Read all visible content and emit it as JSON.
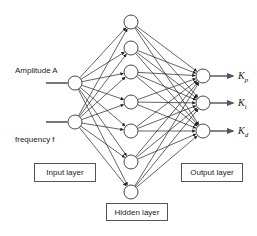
{
  "diagram": {
    "type": "neural-network",
    "inputs": [
      {
        "label": "Amplitude  A",
        "cx": 75,
        "cy": 83
      },
      {
        "label": "frequency  f",
        "cx": 75,
        "cy": 122
      }
    ],
    "hidden": [
      {
        "cx": 131,
        "cy": 22
      },
      {
        "cx": 131,
        "cy": 48
      },
      {
        "cx": 131,
        "cy": 72
      },
      {
        "cx": 131,
        "cy": 102
      },
      {
        "cx": 131,
        "cy": 131
      },
      {
        "cx": 131,
        "cy": 162
      },
      {
        "cx": 131,
        "cy": 192
      }
    ],
    "outputs": [
      {
        "symbol": "K",
        "sub": "p",
        "cx": 203,
        "cy": 76
      },
      {
        "symbol": "K",
        "sub": "i",
        "cx": 203,
        "cy": 103
      },
      {
        "symbol": "K",
        "sub": "d",
        "cx": 203,
        "cy": 131
      }
    ],
    "node_radius": 7,
    "layer_labels": {
      "input": "Input layer",
      "hidden": "Hidden layer",
      "output": "Output layer"
    },
    "colors": {
      "line": "#222222",
      "node_stroke": "#333333",
      "node_fill": "#ffffff",
      "arrow": "#666666"
    }
  }
}
